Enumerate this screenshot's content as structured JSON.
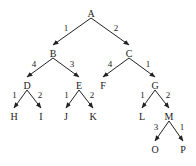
{
  "diagram": {
    "type": "weighted-tree",
    "nodes": [
      {
        "id": "A",
        "label": "A",
        "x": 91,
        "y": 14
      },
      {
        "id": "B",
        "label": "B",
        "x": 53,
        "y": 54
      },
      {
        "id": "C",
        "label": "C",
        "x": 129,
        "y": 54
      },
      {
        "id": "D",
        "label": "D",
        "x": 27,
        "y": 86
      },
      {
        "id": "E",
        "label": "E",
        "x": 79,
        "y": 86
      },
      {
        "id": "F",
        "label": "F",
        "x": 103,
        "y": 86
      },
      {
        "id": "G",
        "label": "G",
        "x": 155,
        "y": 86
      },
      {
        "id": "H",
        "label": "H",
        "x": 14,
        "y": 117
      },
      {
        "id": "I",
        "label": "I",
        "x": 41,
        "y": 117
      },
      {
        "id": "J",
        "label": "J",
        "x": 66,
        "y": 117
      },
      {
        "id": "K",
        "label": "K",
        "x": 93,
        "y": 117
      },
      {
        "id": "L",
        "label": "L",
        "x": 142,
        "y": 117
      },
      {
        "id": "M",
        "label": "M",
        "x": 169,
        "y": 117
      },
      {
        "id": "O",
        "label": "O",
        "x": 155,
        "y": 150
      },
      {
        "id": "P",
        "label": "P",
        "x": 183,
        "y": 150
      }
    ],
    "edges": [
      {
        "from": "A",
        "to": "B",
        "weight": "1"
      },
      {
        "from": "A",
        "to": "C",
        "weight": "2"
      },
      {
        "from": "B",
        "to": "D",
        "weight": "4"
      },
      {
        "from": "B",
        "to": "E",
        "weight": "3"
      },
      {
        "from": "C",
        "to": "F",
        "weight": "4"
      },
      {
        "from": "C",
        "to": "G",
        "weight": "1"
      },
      {
        "from": "D",
        "to": "H",
        "weight": "1"
      },
      {
        "from": "D",
        "to": "I",
        "weight": "2"
      },
      {
        "from": "E",
        "to": "J",
        "weight": "1"
      },
      {
        "from": "E",
        "to": "K",
        "weight": "2"
      },
      {
        "from": "G",
        "to": "L",
        "weight": "1"
      },
      {
        "from": "G",
        "to": "M",
        "weight": "2"
      },
      {
        "from": "M",
        "to": "O",
        "weight": "3"
      },
      {
        "from": "M",
        "to": "P",
        "weight": "1"
      }
    ],
    "colors": {
      "line": "#222222",
      "text": "#1a1a1a",
      "background": "#ffffff"
    }
  }
}
